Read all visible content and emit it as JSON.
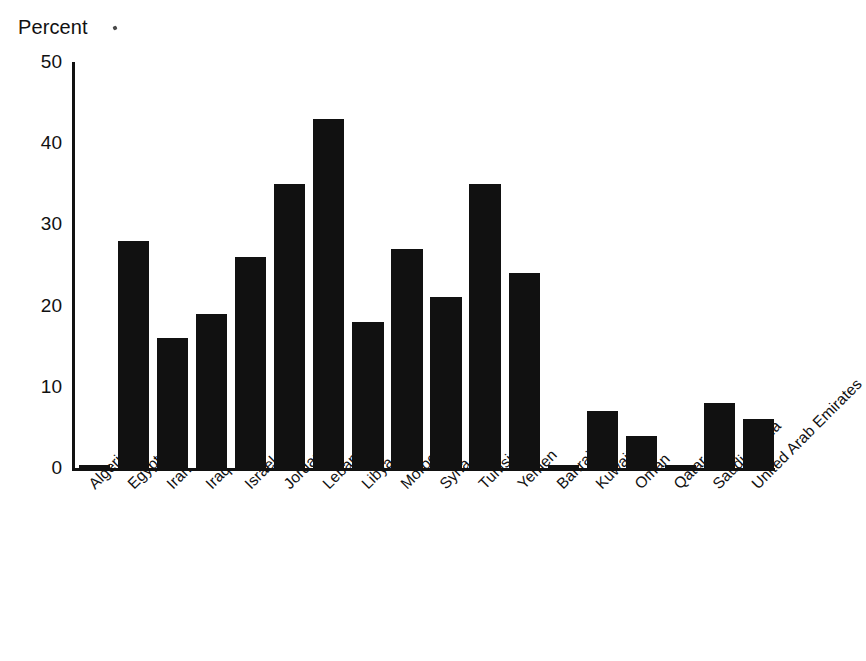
{
  "chart_data": {
    "type": "bar",
    "title": "",
    "subtitle": "",
    "xlabel": "",
    "ylabel": "Percent",
    "ylim": [
      0,
      50
    ],
    "ytick_values": [
      0,
      10,
      20,
      30,
      40,
      50
    ],
    "ytick_labels": [
      "0",
      "10",
      "20",
      "30",
      "40",
      "50"
    ],
    "grid": false,
    "legend": null,
    "bar_color": "#111111",
    "categories": [
      "Algeria",
      "Egypt",
      "Iran",
      "Iraq",
      "Israel",
      "Jordan",
      "Lebanon",
      "Libya",
      "Morocco",
      "Syria",
      "Tunisia",
      "Yemen",
      "Bahrain",
      "Kuwait",
      "Oman",
      "Qatar",
      "Saudi Arabia",
      "United Arab Emirates"
    ],
    "values": [
      0.3,
      28,
      16,
      19,
      26,
      35,
      43,
      18,
      27,
      21,
      35,
      24,
      0.4,
      7,
      4,
      0.4,
      8,
      6
    ]
  },
  "axis": {
    "y_title": "Percent"
  }
}
